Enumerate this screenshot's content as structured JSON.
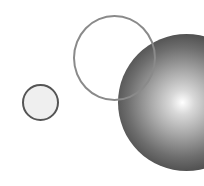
{
  "scene": {
    "background": "#ffffff",
    "shapes": [
      {
        "id": "small-circle",
        "type": "filled-circle",
        "fill": "#efefef",
        "stroke": "#555555"
      },
      {
        "id": "sphere",
        "type": "radial-gradient-sphere",
        "highlight": "#ffffff",
        "shadow": "#1e1e1e"
      },
      {
        "id": "ring",
        "type": "outline-circle",
        "stroke": "#8a8a8a"
      }
    ]
  }
}
